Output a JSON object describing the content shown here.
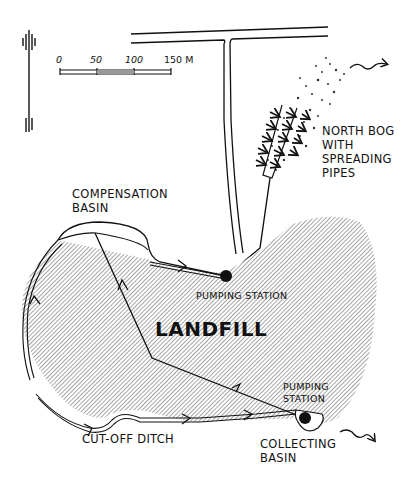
{
  "figure": {
    "type": "site map"
  },
  "scale_bar": {
    "ticks": [
      "0",
      "50",
      "100",
      "150 M"
    ],
    "unit": "M"
  },
  "north_arrow": {
    "icon": "north-arrow-icon"
  },
  "labels": {
    "north_bog": "NORTH BOG\nWITH\nSPREADING\nPIPES",
    "compensation_basin": "COMPENSATION\nBASIN",
    "pumping_station_top": "PUMPING STATION",
    "landfill": "LANDFILL",
    "pumping_station_bottom": "PUMPING\nSTATION",
    "cut_off_ditch": "CUT-OFF DITCH",
    "collecting_basin": "COLLECTING\nBASIN"
  },
  "colors": {
    "ink": "#111111",
    "hatch": "#555555",
    "background": "#ffffff"
  }
}
